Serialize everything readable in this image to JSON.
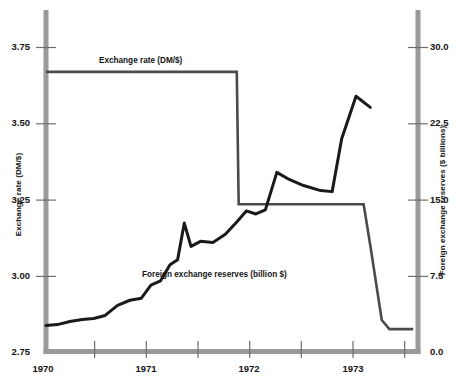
{
  "chart_data": {
    "type": "line",
    "title": "",
    "xlabel": "",
    "grid": false,
    "legend_position": "inline-annotation",
    "axes": {
      "x": {
        "ticks_major": [
          "1970",
          "1971",
          "1972",
          "1973"
        ],
        "tick_values": [
          1970,
          1971,
          1972,
          1973
        ],
        "minor_ticks": [
          1970.5,
          1971.5,
          1972.5,
          1973.5
        ],
        "range": [
          1970,
          1973.9
        ]
      },
      "y_left": {
        "label": "Exchange rate (DM/$)",
        "ticks": [
          "2.75",
          "3.00",
          "3.25",
          "3.50",
          "3.75"
        ],
        "tick_values": [
          2.75,
          3.0,
          3.25,
          3.5,
          3.75
        ],
        "range": [
          2.75,
          3.9
        ]
      },
      "y_right": {
        "label": "Foreign exchange reserves ($ billions)",
        "ticks": [
          "0.0",
          "7.5",
          "15.0",
          "22.5",
          "30.0"
        ],
        "tick_values": [
          0.0,
          7.5,
          15.0,
          22.5,
          30.0
        ],
        "range": [
          0.0,
          34.5
        ]
      }
    },
    "series": [
      {
        "name": "Exchange rate (DM/$)",
        "label": "Exchange rate (DM/$)",
        "axis": "left",
        "color": "#4a4a4a",
        "linewidth": 2.6,
        "points": [
          [
            1970.0,
            3.67
          ],
          [
            1972.0,
            3.67
          ],
          [
            1972.02,
            3.235
          ],
          [
            1973.03,
            3.235
          ],
          [
            1973.33,
            3.235
          ],
          [
            1973.4,
            3.1
          ],
          [
            1973.52,
            2.855
          ],
          [
            1973.6,
            2.825
          ],
          [
            1973.85,
            2.825
          ]
        ]
      },
      {
        "name": "Foreign exchange reserves (billion $)",
        "label": "Foreign exchange reserves (billion $)",
        "axis": "right",
        "color": "#1a1a1a",
        "linewidth": 3.0,
        "points": [
          [
            1970.0,
            2.6
          ],
          [
            1970.12,
            2.7
          ],
          [
            1970.25,
            3.0
          ],
          [
            1970.38,
            3.2
          ],
          [
            1970.5,
            3.3
          ],
          [
            1970.62,
            3.6
          ],
          [
            1970.75,
            4.6
          ],
          [
            1970.88,
            5.1
          ],
          [
            1971.0,
            5.3
          ],
          [
            1971.1,
            6.6
          ],
          [
            1971.2,
            7.0
          ],
          [
            1971.3,
            8.6
          ],
          [
            1971.38,
            9.1
          ],
          [
            1971.45,
            12.7
          ],
          [
            1971.52,
            10.4
          ],
          [
            1971.62,
            10.9
          ],
          [
            1971.75,
            10.8
          ],
          [
            1971.88,
            11.6
          ],
          [
            1972.0,
            12.8
          ],
          [
            1972.1,
            13.9
          ],
          [
            1972.2,
            13.6
          ],
          [
            1972.3,
            14.0
          ],
          [
            1972.42,
            17.7
          ],
          [
            1972.55,
            17.0
          ],
          [
            1972.7,
            16.4
          ],
          [
            1972.88,
            15.9
          ],
          [
            1973.0,
            15.8
          ],
          [
            1973.1,
            21.0
          ],
          [
            1973.25,
            25.2
          ],
          [
            1973.4,
            24.1
          ]
        ]
      }
    ],
    "annotations": [
      {
        "text": "Exchange rate (DM/$)",
        "x": 1970.95,
        "y_left": 3.8
      },
      {
        "text": "Foreign exchange reserves (billion $)",
        "x": 1971.3,
        "y_right": 5.6
      }
    ]
  },
  "axis_labels": {
    "left": "Exchange rate (DM/$)",
    "right": "Foreign exchange reserves ($ billions)"
  },
  "ticks": {
    "left": [
      "3.75",
      "3.50",
      "3.25",
      "3.00",
      "2.75"
    ],
    "right": [
      "30.0",
      "22.5",
      "15.0",
      "7.5",
      "0.0"
    ],
    "x": [
      "1970",
      "1971",
      "1972",
      "1973"
    ]
  },
  "series_labels": {
    "exchange": "Exchange rate (DM/$)",
    "reserves": "Foreign exchange reserves (billion $)"
  },
  "colors": {
    "spine": "#9a9a9a",
    "exchange_line": "#4a4a4a",
    "reserves_line": "#1a1a1a",
    "text": "#141414",
    "background": "#ffffff"
  }
}
